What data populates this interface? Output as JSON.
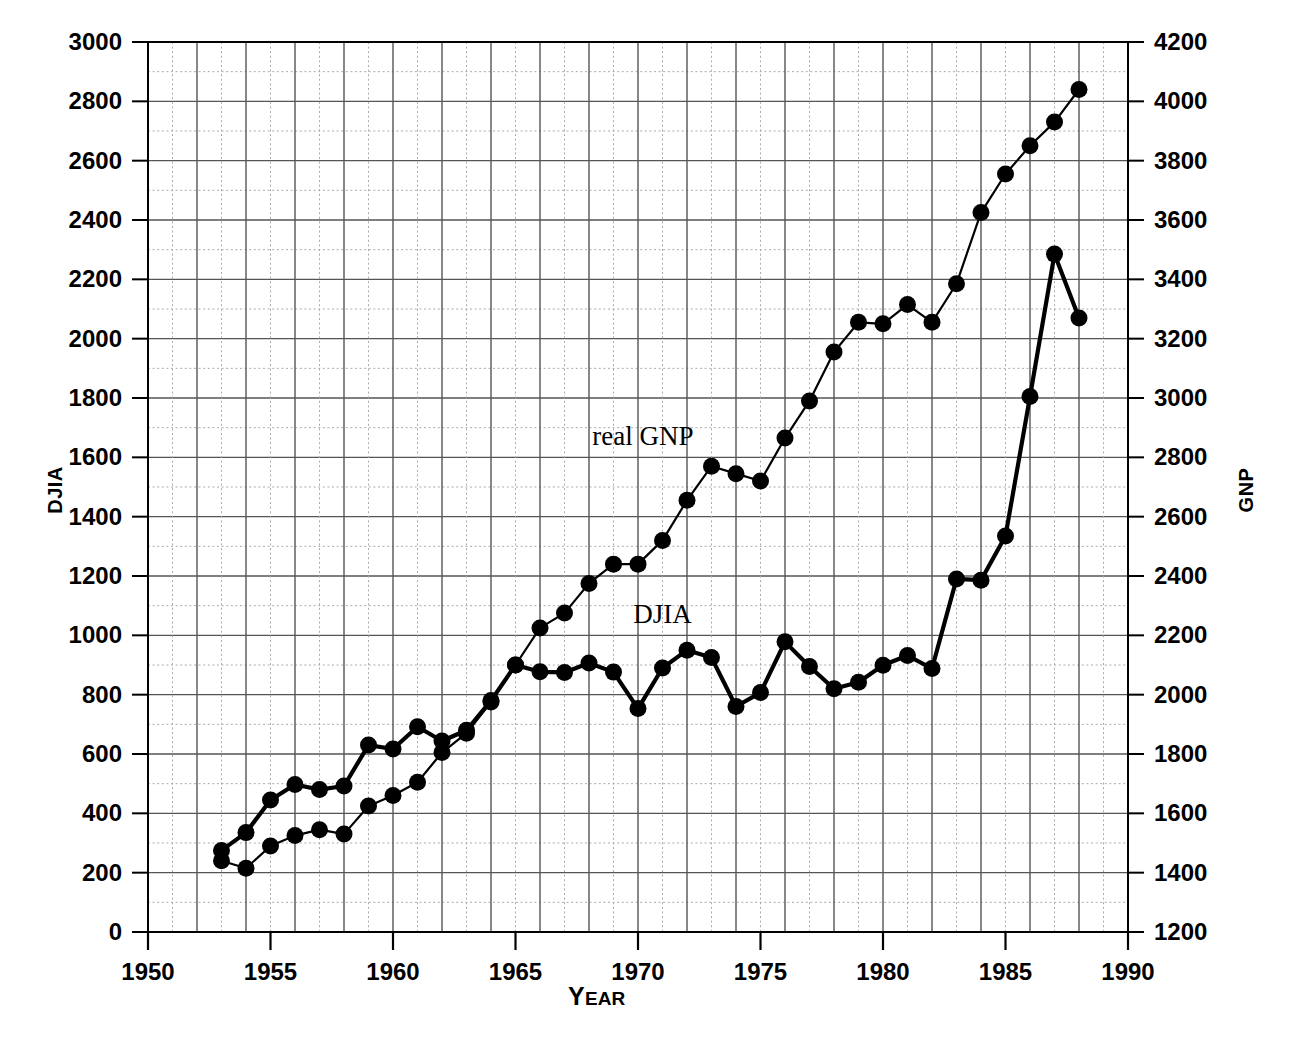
{
  "chart_data": {
    "type": "line",
    "title": "",
    "xlabel": "Year",
    "xlabel_display": "YEAR",
    "x": [
      1953,
      1954,
      1955,
      1956,
      1957,
      1958,
      1959,
      1960,
      1961,
      1962,
      1963,
      1964,
      1965,
      1966,
      1967,
      1968,
      1969,
      1970,
      1971,
      1972,
      1973,
      1974,
      1975,
      1976,
      1977,
      1978,
      1979,
      1980,
      1981,
      1982,
      1983,
      1984,
      1985,
      1986,
      1987,
      1988
    ],
    "xlim": [
      1950,
      1990
    ],
    "xticks": [
      1950,
      1955,
      1960,
      1965,
      1970,
      1975,
      1980,
      1985,
      1990
    ],
    "xticklabels": [
      "1950",
      "1955",
      "1960",
      "1965",
      "1970",
      "1975",
      "1980",
      "1985",
      "1990"
    ],
    "grid": true,
    "grid_major_horizontal_step_djia": 200,
    "grid_minor_horizontal_step_djia": 100,
    "grid_vertical_step_years": 1,
    "legend_position": "inline-annotations",
    "axes": [
      {
        "id": "left",
        "label": "DJIA",
        "lim": [
          0,
          3000
        ],
        "ticks": [
          0,
          200,
          400,
          600,
          800,
          1000,
          1200,
          1400,
          1600,
          1800,
          2000,
          2200,
          2400,
          2600,
          2800,
          3000
        ],
        "ticklabels": [
          "0",
          "200",
          "400",
          "600",
          "800",
          "1000",
          "1200",
          "1400",
          "1600",
          "1800",
          "2000",
          "2200",
          "2400",
          "2600",
          "2800",
          "3000"
        ]
      },
      {
        "id": "right",
        "label": "GNP",
        "lim": [
          1200,
          4200
        ],
        "ticks": [
          1200,
          1400,
          1600,
          1800,
          2000,
          2200,
          2400,
          2600,
          2800,
          3000,
          3200,
          3400,
          3600,
          3800,
          4000,
          4200
        ],
        "ticklabels": [
          "1200",
          "1400",
          "1600",
          "1800",
          "2000",
          "2200",
          "2400",
          "2600",
          "2800",
          "3000",
          "3200",
          "3400",
          "3600",
          "3800",
          "4000",
          "4200"
        ]
      }
    ],
    "series": [
      {
        "name": "DJIA",
        "annotation": "DJIA",
        "axis": "left",
        "units": "index points",
        "marker": "filled-circle",
        "line_style": "solid-thick",
        "values": [
          275,
          335,
          445,
          497,
          480,
          492,
          630,
          617,
          692,
          644,
          680,
          780,
          900,
          877,
          875,
          907,
          876,
          753,
          890,
          950,
          925,
          760,
          807,
          978,
          895,
          820,
          842,
          899,
          932,
          888,
          1190,
          1186,
          1335,
          1805,
          2285,
          2070
        ]
      },
      {
        "name": "real GNP",
        "annotation": "real GNP",
        "axis": "right",
        "units": "billions of dollars",
        "marker": "filled-circle",
        "line_style": "solid-thin",
        "values": [
          1440,
          1415,
          1490,
          1525,
          1545,
          1530,
          1625,
          1660,
          1705,
          1805,
          1870,
          1975,
          2100,
          2225,
          2275,
          2375,
          2440,
          2440,
          2520,
          2655,
          2770,
          2745,
          2720,
          2865,
          2990,
          3155,
          3255,
          3250,
          3315,
          3255,
          3385,
          3625,
          3755,
          3850,
          3930,
          4040
        ]
      }
    ],
    "annotations": [
      {
        "text": "real GNP",
        "x_year": 1970.2,
        "y_djia": 1640
      },
      {
        "text": "DJIA",
        "x_year": 1971.0,
        "y_djia": 1040
      }
    ]
  },
  "axis_titles": {
    "left": "DJIA",
    "right": "GNP",
    "bottom_first_letter": "Y",
    "bottom_rest": "EAR"
  },
  "colors": {
    "ink": "#000000",
    "grid_major": "#555555",
    "grid_minor": "#aaaaaa",
    "background": "#ffffff"
  }
}
